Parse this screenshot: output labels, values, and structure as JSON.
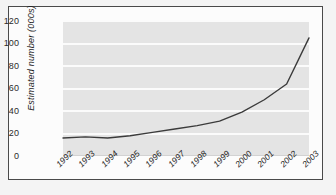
{
  "chart_data": {
    "type": "line",
    "title": "",
    "subtitle": "",
    "xlabel": "",
    "ylabel": "Estimated number (000s)",
    "categories": [
      "1992",
      "1993",
      "1994",
      "1995",
      "1996",
      "1997",
      "1998",
      "1999",
      "2000",
      "2001",
      "2002",
      "2003"
    ],
    "series": [
      {
        "name": "Estimated number",
        "values": [
          16,
          17,
          16,
          18,
          21,
          24,
          27,
          31,
          39,
          50,
          64,
          105
        ]
      }
    ],
    "ylim": [
      0,
      120
    ],
    "yticks": [
      0,
      20,
      40,
      60,
      80,
      100,
      120
    ],
    "ytick_labels": [
      "0",
      "20",
      "40",
      "60",
      "80",
      "100",
      "120"
    ],
    "grid": true,
    "grid_axis": "y",
    "legend": false,
    "legend_position": "none",
    "colors": {
      "line": "#3b3b3b",
      "plot_background": "#e4e4e4",
      "gridline": "#fbfbfb",
      "card_background": "#fcfcfc",
      "card_border": "#4a4a4a",
      "page_background": "#f4f4f4",
      "tick_label": "#1e1e1e"
    }
  }
}
